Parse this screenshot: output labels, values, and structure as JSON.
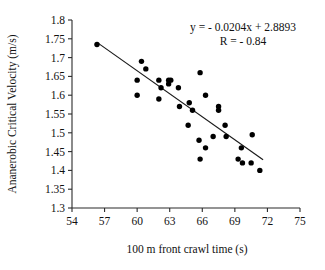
{
  "chart_data": {
    "type": "scatter",
    "title": "",
    "xlabel": "100 m front crawl time (s)",
    "ylabel": "Ananerobic Critical Velocity (m/s)",
    "xlim": [
      54,
      75
    ],
    "ylim": [
      1.3,
      1.8
    ],
    "xticks": [
      54,
      57,
      60,
      63,
      66,
      69,
      72,
      75
    ],
    "yticks": [
      1.3,
      1.35,
      1.4,
      1.45,
      1.5,
      1.55,
      1.6,
      1.65,
      1.7,
      1.75,
      1.8
    ],
    "xtick_labels": [
      "54",
      "57",
      "60",
      "63",
      "66",
      "69",
      "72",
      "75"
    ],
    "ytick_labels": [
      "1.3",
      "1.35",
      "1.4",
      "1.45",
      "1.5",
      "1.55",
      "1.6",
      "1.65",
      "1.7",
      "1.75",
      "1.8"
    ],
    "grid": false,
    "legend": false,
    "marker": "filled-circle",
    "marker_color": "#000000",
    "annotations": [
      "y = - 0.0204x + 2.8893",
      "R = - 0.84"
    ],
    "equation": "y = - 0.0204x + 2.8893",
    "correlation_label": "R = - 0.84",
    "slope": -0.0204,
    "intercept": 2.8893,
    "r": -0.84,
    "trendline": {
      "x_start": 56.3,
      "y_start": 1.7405,
      "x_end": 71.6,
      "y_end": 1.4284,
      "color": "#1a1a1a"
    },
    "points": [
      {
        "x": 56.3,
        "y": 1.735
      },
      {
        "x": 60.0,
        "y": 1.64
      },
      {
        "x": 60.0,
        "y": 1.6
      },
      {
        "x": 60.4,
        "y": 1.69
      },
      {
        "x": 60.8,
        "y": 1.67
      },
      {
        "x": 62.0,
        "y": 1.64
      },
      {
        "x": 62.0,
        "y": 1.59
      },
      {
        "x": 62.2,
        "y": 1.62
      },
      {
        "x": 62.9,
        "y": 1.64
      },
      {
        "x": 62.9,
        "y": 1.63
      },
      {
        "x": 63.1,
        "y": 1.64
      },
      {
        "x": 63.8,
        "y": 1.62
      },
      {
        "x": 63.9,
        "y": 1.57
      },
      {
        "x": 64.8,
        "y": 1.58
      },
      {
        "x": 64.7,
        "y": 1.52
      },
      {
        "x": 65.1,
        "y": 1.56
      },
      {
        "x": 65.8,
        "y": 1.66
      },
      {
        "x": 65.7,
        "y": 1.48
      },
      {
        "x": 65.8,
        "y": 1.43
      },
      {
        "x": 66.3,
        "y": 1.6
      },
      {
        "x": 66.3,
        "y": 1.46
      },
      {
        "x": 67.0,
        "y": 1.49
      },
      {
        "x": 67.5,
        "y": 1.57
      },
      {
        "x": 67.5,
        "y": 1.56
      },
      {
        "x": 68.1,
        "y": 1.52
      },
      {
        "x": 68.2,
        "y": 1.49
      },
      {
        "x": 69.3,
        "y": 1.43
      },
      {
        "x": 69.6,
        "y": 1.46
      },
      {
        "x": 69.7,
        "y": 1.42
      },
      {
        "x": 70.5,
        "y": 1.42
      },
      {
        "x": 70.6,
        "y": 1.495
      },
      {
        "x": 71.3,
        "y": 1.4
      }
    ]
  }
}
